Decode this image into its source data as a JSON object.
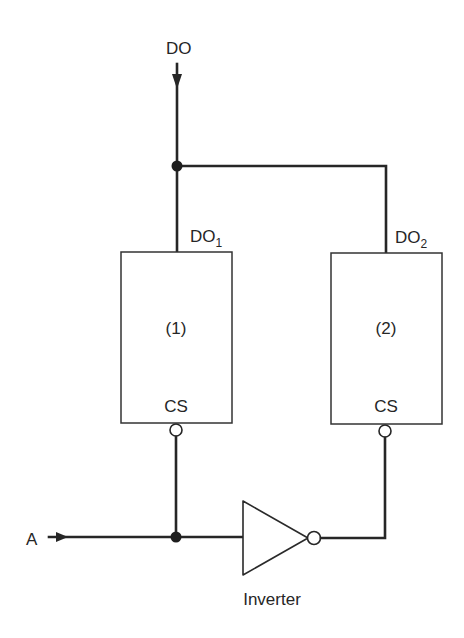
{
  "diagram": {
    "type": "logic-circuit",
    "labels": {
      "output_bus": "DO",
      "chip1_output": "DO",
      "chip1_output_sub": "1",
      "chip2_output": "DO",
      "chip2_output_sub": "2",
      "chip1_name": "(1)",
      "chip2_name": "(2)",
      "chip1_select": "CS",
      "chip2_select": "CS",
      "input": "A",
      "inverter": "Inverter"
    },
    "nodes": [
      {
        "id": "chip1",
        "label": "(1)",
        "pin_top": "DO1",
        "pin_bottom": "CS (active low)"
      },
      {
        "id": "chip2",
        "label": "(2)",
        "pin_top": "DO2",
        "pin_bottom": "CS (active low)"
      },
      {
        "id": "inverter",
        "label": "Inverter"
      },
      {
        "id": "A",
        "label": "A",
        "kind": "input"
      },
      {
        "id": "DO",
        "label": "DO",
        "kind": "output"
      }
    ],
    "edges": [
      {
        "from": "chip1.DO1",
        "to": "DO"
      },
      {
        "from": "chip2.DO2",
        "to": "DO"
      },
      {
        "from": "A",
        "to": "chip1.CS"
      },
      {
        "from": "A",
        "to": "inverter"
      },
      {
        "from": "inverter",
        "to": "chip2.CS"
      }
    ],
    "colors": {
      "ink": "#262626",
      "background": "#ffffff"
    }
  }
}
